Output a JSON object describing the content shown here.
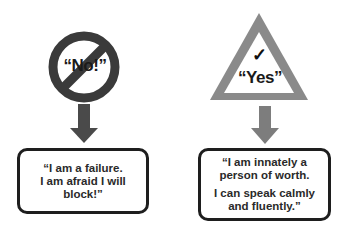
{
  "colors": {
    "no_sign": "#3a3a3a",
    "yes_sign": "#8a8a8a",
    "left_arrow": "#4a4a4a",
    "right_arrow": "#7d7d7d",
    "box_border": "#1e1e1e",
    "text": "#2a2a2a"
  },
  "left": {
    "sign": {
      "icon": "prohibition-sign-icon",
      "label": "“No!”"
    },
    "arrow": {
      "icon": "arrow-down-icon"
    },
    "box": {
      "lines": [
        "“I am a failure.",
        "I am afraid I will",
        "block!”"
      ]
    }
  },
  "right": {
    "sign": {
      "icon": "warning-triangle-icon",
      "check": "✓",
      "label": "“Yes”"
    },
    "arrow": {
      "icon": "arrow-down-icon"
    },
    "box": {
      "paragraph1": [
        "“I am innately a",
        "person of worth."
      ],
      "paragraph2": [
        "I can speak calmly",
        "and fluently.”"
      ]
    }
  }
}
